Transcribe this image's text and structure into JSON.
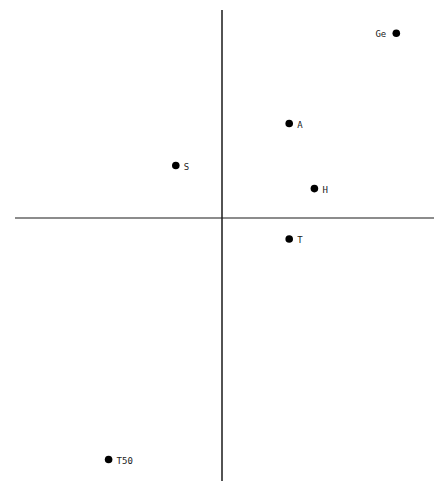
{
  "chart_data": {
    "type": "scatter",
    "title": "",
    "xlabel": "",
    "ylabel": "",
    "grid": false,
    "legend": null,
    "axes": "crossing at origin, no tick marks or tick labels",
    "xlim": [
      -1.0,
      1.0
    ],
    "ylim": [
      -1.26,
      1.0
    ],
    "points": [
      {
        "label": "Ge",
        "x": 0.83,
        "y": 0.88,
        "label_side": "left"
      },
      {
        "label": "A",
        "x": 0.32,
        "y": 0.45,
        "label_side": "right"
      },
      {
        "label": "S",
        "x": -0.22,
        "y": 0.25,
        "label_side": "right"
      },
      {
        "label": "H",
        "x": 0.44,
        "y": 0.14,
        "label_side": "right"
      },
      {
        "label": "T",
        "x": 0.32,
        "y": -0.1,
        "label_side": "right"
      },
      {
        "label": "T50",
        "x": -0.54,
        "y": -1.15,
        "label_side": "right"
      }
    ]
  },
  "colors": {
    "axis": "#1a1a1a",
    "point": "#000000",
    "label": "#222222",
    "background": "#ffffff"
  }
}
